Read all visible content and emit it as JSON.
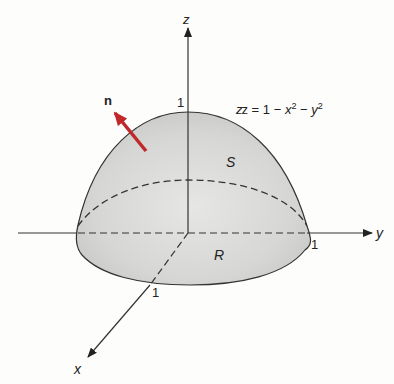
{
  "diagram": {
    "axes": {
      "z_label": "z",
      "y_label": "y",
      "x_label": "x"
    },
    "ticks": {
      "z_one": "1",
      "y_one": "1",
      "x_one": "1"
    },
    "equation": {
      "lhs": "z = 1 − ",
      "x": "x",
      "exp1": "2",
      "mid": " − ",
      "y": "y",
      "exp2": "2"
    },
    "surface_label": "S",
    "region_label": "R",
    "normal_label": "n",
    "colors": {
      "normal_arrow": "#c0282a",
      "surface_fill": "#d9d9d7",
      "outline": "#333333",
      "background": "#fdfdfb"
    }
  }
}
